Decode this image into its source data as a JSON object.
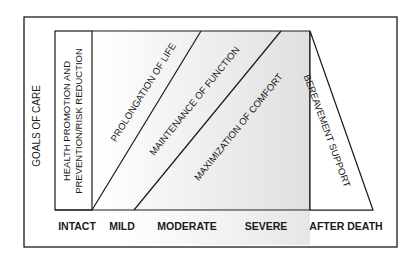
{
  "diagram": {
    "y_axis_label": "GOALS OF CARE",
    "goals": [
      {
        "id": "health",
        "line1": "HEALTH PROMOTION AND",
        "line2": "PREVENTION/RISK REDUCTION"
      },
      {
        "id": "life",
        "label": "PROLONGATION OF LIFE"
      },
      {
        "id": "function",
        "label": "MAINTENANCE OF FUNCTION"
      },
      {
        "id": "comfort",
        "label": "MAXIMIZATION OF COMFORT"
      },
      {
        "id": "bereavement",
        "label": "BEREAVEMENT SUPPORT"
      }
    ],
    "stages": [
      "INTACT",
      "MILD",
      "MODERATE",
      "SEVERE",
      "AFTER DEATH"
    ],
    "colors": {
      "line": "#1a1a1a",
      "shade_light": "#ffffff",
      "shade_dark": "#e2e2e2"
    }
  }
}
